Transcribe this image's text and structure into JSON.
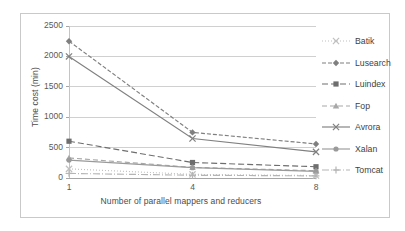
{
  "chart_data": {
    "type": "line",
    "title": "",
    "xlabel": "Number of parallel mappers and reducers",
    "ylabel": "Time cost (min)",
    "categories": [
      "1",
      "4",
      "8"
    ],
    "x": [
      1,
      4,
      8
    ],
    "xtick_labels": [
      "1",
      "4",
      "8"
    ],
    "ytick_labels": [
      "0",
      "500",
      "1000",
      "1500",
      "2000",
      "2500"
    ],
    "yticks": [
      0,
      500,
      1000,
      1500,
      2000,
      2500
    ],
    "ylim": [
      0,
      2500
    ],
    "grid": "horizontal",
    "legend_position": "right",
    "series": [
      {
        "name": "Batik",
        "values": [
          150,
          60,
          40
        ],
        "color": "#bfbfbf",
        "dash": "1,2",
        "marker": "x"
      },
      {
        "name": "Lusearch",
        "values": [
          2250,
          750,
          560
        ],
        "color": "#7f7f7f",
        "dash": "4,2",
        "marker": "diamond"
      },
      {
        "name": "Luindex",
        "values": [
          605,
          255,
          185
        ],
        "color": "#6e6e6e",
        "dash": "6,3",
        "marker": "square"
      },
      {
        "name": "Fop",
        "values": [
          330,
          175,
          120
        ],
        "color": "#a8a8a8",
        "dash": "5,3",
        "marker": "triangle"
      },
      {
        "name": "Avrora",
        "values": [
          2000,
          650,
          430
        ],
        "color": "#808080",
        "dash": "",
        "marker": "x"
      },
      {
        "name": "Xalan",
        "values": [
          295,
          170,
          110
        ],
        "color": "#9a9a9a",
        "dash": "",
        "marker": "circle"
      },
      {
        "name": "Tomcat",
        "values": [
          75,
          45,
          35
        ],
        "color": "#b5b5b5",
        "dash": "7,2,1,2",
        "marker": "plus"
      }
    ]
  },
  "axes": {
    "y_title": "Time cost (min)",
    "x_title": "Number of parallel mappers and reducers"
  },
  "legend": {
    "items": [
      {
        "label": "Batik"
      },
      {
        "label": "Lusearch"
      },
      {
        "label": "Luindex"
      },
      {
        "label": "Fop"
      },
      {
        "label": "Avrora"
      },
      {
        "label": "Xalan"
      },
      {
        "label": "Tomcat"
      }
    ]
  }
}
